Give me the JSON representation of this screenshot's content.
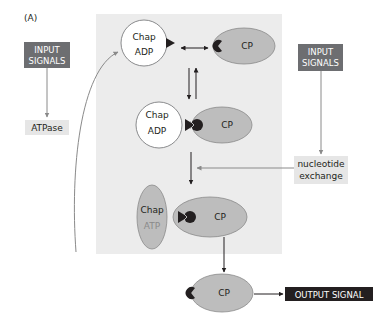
{
  "figure": {
    "panel_label": "(A)",
    "colors": {
      "panel_bg": "#ececec",
      "cp_fill": "#bdbdbd",
      "chap_adp_fill": "#ffffff",
      "chap_atp_fill": "#bdbdbd",
      "signal_box": "#6d6e71",
      "output_box": "#231f20",
      "label_box": "#e6e6e6",
      "arrow_dark": "#231f20",
      "arrow_gray": "#8a8a8a"
    },
    "left_input": {
      "line1": "INPUT",
      "line2": "SIGNALS"
    },
    "atpase_label": "ATPase",
    "right_input": {
      "line1": "INPUT",
      "line2": "SIGNALS"
    },
    "nucleotide_exchange": {
      "line1": "nucleotide",
      "line2": "exchange"
    },
    "state1": {
      "chap_line1": "Chap",
      "chap_line2": "ADP",
      "cp": "CP"
    },
    "state2": {
      "chap_line1": "Chap",
      "chap_line2": "ADP",
      "cp": "CP"
    },
    "state3": {
      "chap_line1": "Chap",
      "chap_line2": "ATP",
      "cp": "CP"
    },
    "released": {
      "cp": "CP"
    },
    "output_signal": "OUTPUT SIGNAL"
  }
}
